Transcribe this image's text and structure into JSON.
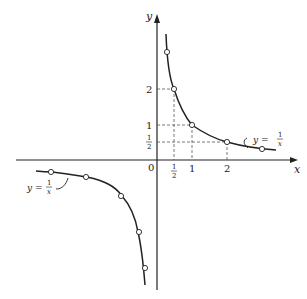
{
  "diagram": {
    "equation_label_upper": {
      "lhs": "y =",
      "num": "1",
      "den": "x"
    },
    "equation_label_lower": {
      "lhs": "y =",
      "num": "1",
      "den": "x"
    },
    "axes": {
      "x_label": "x",
      "y_label": "y",
      "origin_label": "0",
      "x_ticks": [
        {
          "value": 0.5,
          "label_num": "1",
          "label_den": "2"
        },
        {
          "value": 1,
          "label": "1"
        },
        {
          "value": 2,
          "label": "2"
        }
      ],
      "y_ticks": [
        {
          "value": 2,
          "label": "2"
        },
        {
          "value": 1,
          "label": "1"
        },
        {
          "value": 0.5,
          "label_num": "1",
          "label_den": "2"
        }
      ]
    },
    "points_q1": [
      [
        0.333,
        3
      ],
      [
        0.5,
        2
      ],
      [
        1,
        1
      ],
      [
        2,
        0.5
      ],
      [
        3,
        0.333
      ]
    ],
    "points_q3": [
      [
        -3,
        -0.333
      ],
      [
        -2,
        -0.5
      ],
      [
        -1,
        -1
      ],
      [
        -0.5,
        -2
      ],
      [
        -0.333,
        -3
      ]
    ],
    "colors": {
      "ink": "#222222",
      "dashes": "#555555",
      "background": "#ffffff"
    }
  }
}
